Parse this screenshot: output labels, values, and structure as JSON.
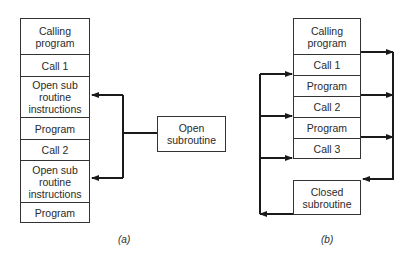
{
  "diagram_a": {
    "caption": "(a)",
    "blocks": [
      {
        "label": "Calling program"
      },
      {
        "label": "Call 1"
      },
      {
        "label": "Open sub routine instructions"
      },
      {
        "label": "Program"
      },
      {
        "label": "Call 2"
      },
      {
        "label": "Open sub routine instructions"
      },
      {
        "label": "Program"
      }
    ],
    "subroutine": {
      "label": "Open subroutine"
    }
  },
  "diagram_b": {
    "caption": "(b)",
    "blocks": [
      {
        "label": "Calling program"
      },
      {
        "label": "Call 1"
      },
      {
        "label": "Program"
      },
      {
        "label": "Call 2"
      },
      {
        "label": "Program"
      },
      {
        "label": "Call 3"
      }
    ],
    "subroutine": {
      "label": "Closed subroutine"
    }
  },
  "colors": {
    "line": "#1a1a1a",
    "border": "#333333",
    "background": "#ffffff"
  }
}
